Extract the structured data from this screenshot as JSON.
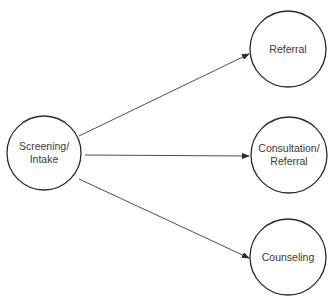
{
  "diagram": {
    "type": "flow",
    "source": {
      "id": "screening",
      "label_line1": "Screening/",
      "label_line2": "Intake"
    },
    "targets": [
      {
        "id": "referral",
        "label_line1": "Referral",
        "label_line2": ""
      },
      {
        "id": "consultation",
        "label_line1": "Consultation/",
        "label_line2": "Referral"
      },
      {
        "id": "counseling",
        "label_line1": "Counseling",
        "label_line2": ""
      }
    ],
    "edges": [
      {
        "from": "screening",
        "to": "referral"
      },
      {
        "from": "screening",
        "to": "consultation"
      },
      {
        "from": "screening",
        "to": "counseling"
      }
    ],
    "colors": {
      "stroke": "#2a2a2a",
      "text": "#3a3a3a",
      "background": "#ffffff"
    }
  }
}
